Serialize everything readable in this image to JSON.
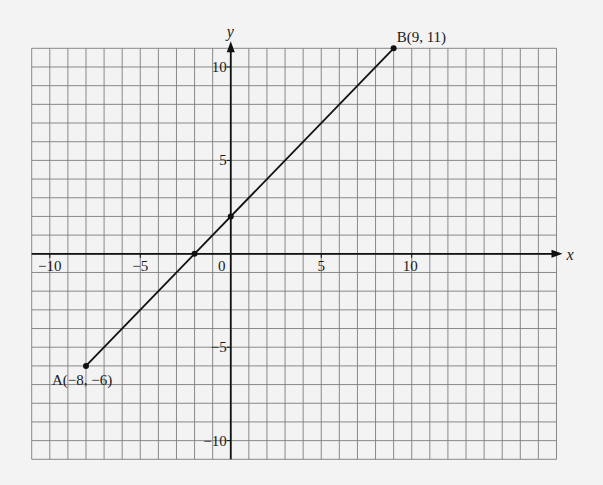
{
  "chart_data": {
    "type": "line",
    "title": "",
    "xlabel": "x",
    "ylabel": "y",
    "xlim": [
      -11,
      18
    ],
    "ylim": [
      -11,
      11
    ],
    "grid": true,
    "grid_step": 1,
    "x_ticks": [
      {
        "value": -10,
        "label": "−10"
      },
      {
        "value": -5,
        "label": "−5"
      },
      {
        "value": 0,
        "label": "0"
      },
      {
        "value": 5,
        "label": "5"
      },
      {
        "value": 10,
        "label": "10"
      }
    ],
    "y_ticks": [
      {
        "value": 10,
        "label": "10"
      },
      {
        "value": 5,
        "label": "5"
      },
      {
        "value": -5,
        "label": "−5"
      },
      {
        "value": -10,
        "label": "−10"
      }
    ],
    "series": [
      {
        "name": "segment AB",
        "x": [
          -8,
          9
        ],
        "y": [
          -6,
          11
        ],
        "equation": "y = x + 2"
      }
    ],
    "points": [
      {
        "name": "A",
        "x": -8,
        "y": -6,
        "label": "A(−8, −6)"
      },
      {
        "name": "B",
        "x": 9,
        "y": 11,
        "label": "B(9, 11)"
      },
      {
        "name": "y-intercept",
        "x": 0,
        "y": 2,
        "label": ""
      },
      {
        "name": "x-intercept",
        "x": -2,
        "y": 0,
        "label": ""
      }
    ],
    "legend": null
  },
  "colors": {
    "background": "#f3f3f3",
    "grid": "#7d7d7d",
    "axis": "#111111",
    "line": "#111111"
  }
}
